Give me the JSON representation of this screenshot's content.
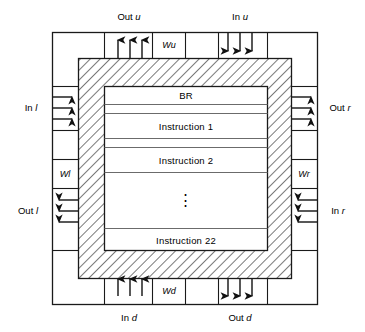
{
  "diagram": {
    "colors": {
      "line": "#1a1a1a",
      "hatch": "#555555",
      "divider": "#666666",
      "background": "#ffffff"
    },
    "ports": {
      "top": {
        "out_label_prefix": "Out",
        "out_label_italic": "u",
        "out_direction": "up",
        "out_arrow_count": 3,
        "w_box_label_prefix": "W",
        "w_box_label_italic": "u",
        "in_label_prefix": "In",
        "in_label_italic": "u",
        "in_direction": "down",
        "in_arrow_count": 3
      },
      "left": {
        "in_label_prefix": "In",
        "in_label_italic": "l",
        "in_direction": "right",
        "in_arrow_count": 3,
        "w_box_label_prefix": "W",
        "w_box_label_italic": "l",
        "out_label_prefix": "Out",
        "out_label_italic": "l",
        "out_direction": "left",
        "out_arrow_count": 3
      },
      "right": {
        "out_label_prefix": "Out",
        "out_label_italic": "r",
        "out_direction": "right",
        "out_arrow_count": 3,
        "w_box_label_prefix": "W",
        "w_box_label_italic": "r",
        "in_label_prefix": "In",
        "in_label_italic": "r",
        "in_direction": "left",
        "in_arrow_count": 3
      },
      "bottom": {
        "in_label_prefix": "In",
        "in_label_italic": "d",
        "in_direction": "up",
        "in_arrow_count": 3,
        "w_box_label_prefix": "W",
        "w_box_label_italic": "d",
        "out_label_prefix": "Out",
        "out_label_italic": "d",
        "out_direction": "down",
        "out_arrow_count": 3
      }
    },
    "core": {
      "rows": [
        {
          "label": "BR"
        },
        {
          "label": "Instruction 1"
        },
        {
          "label": "Instruction 2"
        },
        {
          "label": "⋮",
          "is_ellipsis": true
        },
        {
          "label": "Instruction 22"
        }
      ]
    }
  }
}
